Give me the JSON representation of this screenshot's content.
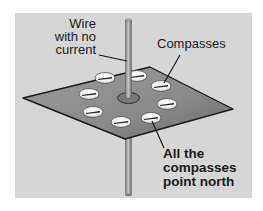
{
  "diagram": {
    "background_color": "#d6d6d6",
    "plate_color": "#8a8a8a",
    "wire_color": "#9a9a9a",
    "labels": {
      "wire": [
        "Wire",
        "with no",
        "current"
      ],
      "compasses": "Compasses",
      "result": [
        "All the",
        "compasses",
        "point north"
      ]
    },
    "compass_count": 8,
    "compass_needle_direction": "north"
  }
}
